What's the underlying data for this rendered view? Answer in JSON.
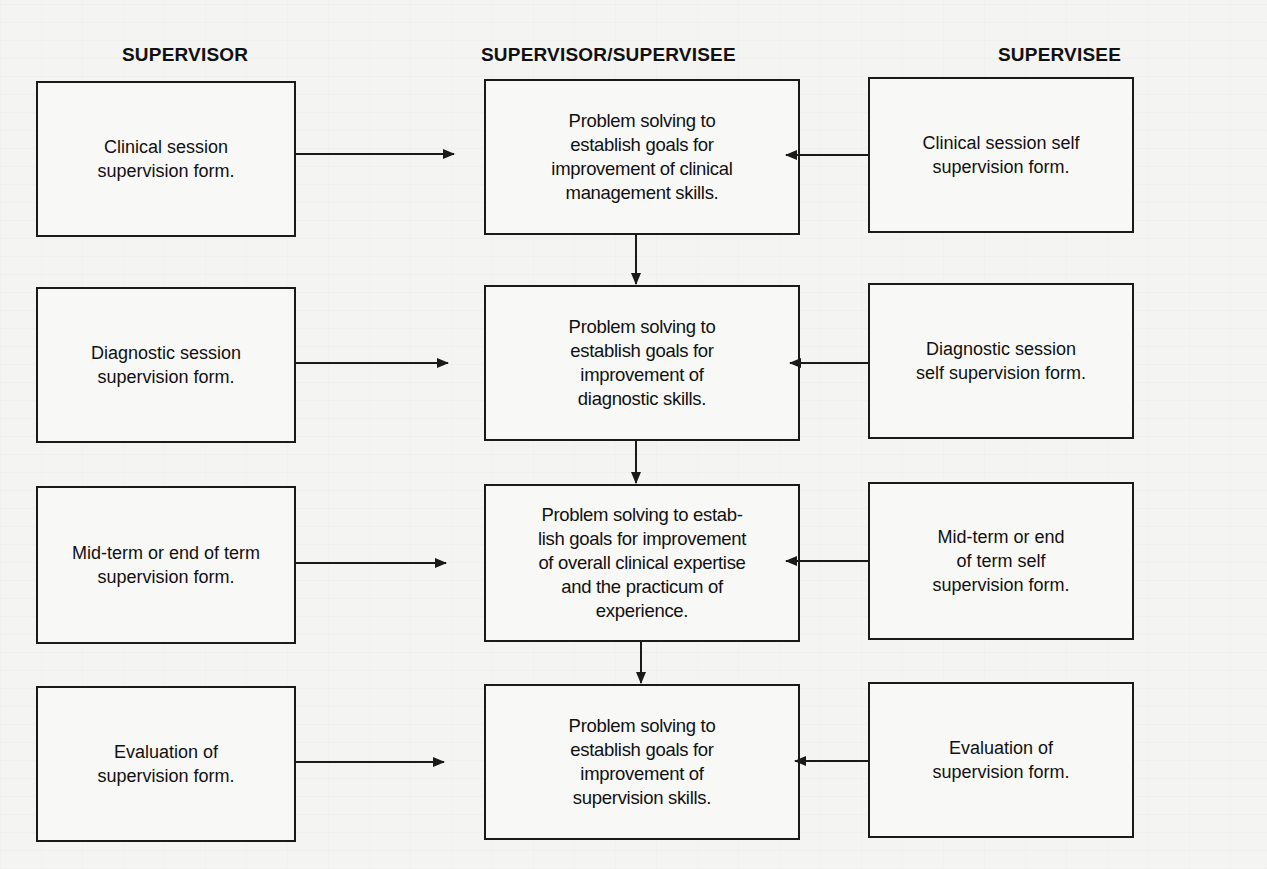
{
  "columns": {
    "left": "SUPERVISOR",
    "center": "SUPERVISOR/SUPERVISEE",
    "right": "SUPERVISEE"
  },
  "rows": [
    {
      "supervisor": "Clinical session\nsupervision form.",
      "joint": "Problem solving to\nestablish goals for\nimprovement of clinical\nmanagement skills.",
      "supervisee": "Clinical session self\nsupervision form."
    },
    {
      "supervisor": "Diagnostic session\nsupervision form.",
      "joint": "Problem solving to\nestablish goals for\nimprovement of\ndiagnostic skills.",
      "supervisee": "Diagnostic session\nself supervision form."
    },
    {
      "supervisor": "Mid-term or end of term\nsupervision form.",
      "joint": "Problem solving to estab-\nlish goals for improvement\nof overall clinical expertise\nand the practicum of\nexperience.",
      "supervisee": "Mid-term or end\nof term self\nsupervision form."
    },
    {
      "supervisor": "Evaluation of\nsupervision form.",
      "joint": "Problem solving to\nestablish goals for\nimprovement of\nsupervision skills.",
      "supervisee": "Evaluation of\nsupervision form."
    }
  ],
  "colors": {
    "line": "#1a1a1a",
    "paper": "#f4f4f2"
  }
}
